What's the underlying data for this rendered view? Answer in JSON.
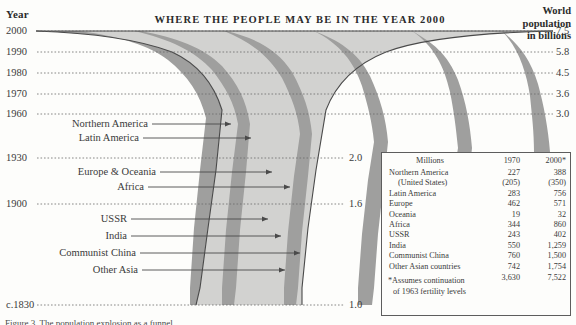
{
  "header": {
    "year_axis_title": "Year",
    "chart_title": "WHERE THE PEOPLE MAY BE IN THE YEAR 2000",
    "right_axis_title_line1": "World",
    "right_axis_title_line2": "population",
    "right_axis_title_line3": "in billions"
  },
  "figure_caption": "Figure 3. The population explosion as a funnel",
  "chart_data": {
    "type": "area",
    "title": "WHERE THE PEOPLE MAY BE IN THE YEAR 2000",
    "subtitle": "World population in billions",
    "xlabel": "World population in billions",
    "ylabel": "Year",
    "grid": true,
    "legend": "callout-labels",
    "orientation": "horizontal-funnel",
    "y_ticks": [
      "2000",
      "1990",
      "1980",
      "1970",
      "1960",
      "1930",
      "1900",
      "c.1830"
    ],
    "x_tick_labels": [
      "7.5",
      "5.8",
      "4.5",
      "3.6",
      "3.0",
      "2.0",
      "1.6",
      "1.0"
    ],
    "pairs": [
      {
        "year": "2000",
        "world_population_billions": 7.5
      },
      {
        "year": "1990",
        "world_population_billions": 5.8
      },
      {
        "year": "1980",
        "world_population_billions": 4.5
      },
      {
        "year": "1970",
        "world_population_billions": 3.6
      },
      {
        "year": "1960",
        "world_population_billions": 3.0
      },
      {
        "year": "1930",
        "world_population_billions": 2.0
      },
      {
        "year": "1900",
        "world_population_billions": 1.6
      },
      {
        "year": "c.1830",
        "world_population_billions": 1.0
      }
    ],
    "bands": [
      "Northern America",
      "Latin America",
      "Europe & Oceania",
      "Africa",
      "USSR",
      "India",
      "Communist China",
      "Other Asia"
    ]
  },
  "callouts": [
    {
      "label": "Northern America"
    },
    {
      "label": "Latin America"
    },
    {
      "label": "Europe & Oceania"
    },
    {
      "label": "Africa"
    },
    {
      "label": "USSR"
    },
    {
      "label": "India"
    },
    {
      "label": "Communist China"
    },
    {
      "label": "Other Asia"
    }
  ],
  "table": {
    "col_header_name": "Millions",
    "col_header_1970": "1970",
    "col_header_2000": "2000*",
    "rows": [
      {
        "name": "Northern America",
        "v1970": "227",
        "v2000": "388",
        "indent": false
      },
      {
        "name": "(United States)",
        "v1970": "(205)",
        "v2000": "(350)",
        "indent": true
      },
      {
        "name": "Latin America",
        "v1970": "283",
        "v2000": "756",
        "indent": false
      },
      {
        "name": "Europe",
        "v1970": "462",
        "v2000": "571",
        "indent": false
      },
      {
        "name": "Oceania",
        "v1970": "19",
        "v2000": "32",
        "indent": false
      },
      {
        "name": "Africa",
        "v1970": "344",
        "v2000": "860",
        "indent": false
      },
      {
        "name": "USSR",
        "v1970": "243",
        "v2000": "402",
        "indent": false
      },
      {
        "name": "India",
        "v1970": "550",
        "v2000": "1,259",
        "indent": false
      },
      {
        "name": "Communist China",
        "v1970": "760",
        "v2000": "1,500",
        "indent": false
      },
      {
        "name": "Other Asian countries",
        "v1970": "742",
        "v2000": "1,754",
        "indent": false
      }
    ],
    "total": {
      "name": "",
      "v1970": "3,630",
      "v2000": "7,522"
    },
    "footnote_line1": "*Assumes continuation",
    "footnote_line2": "of 1963 fertility levels"
  },
  "colors": {
    "band_light": "#d2d2d0",
    "band_dark": "#9f9f9e",
    "outline": "#4a4a4a",
    "text": "#2b2b2b",
    "background": "#fdfdfb"
  }
}
